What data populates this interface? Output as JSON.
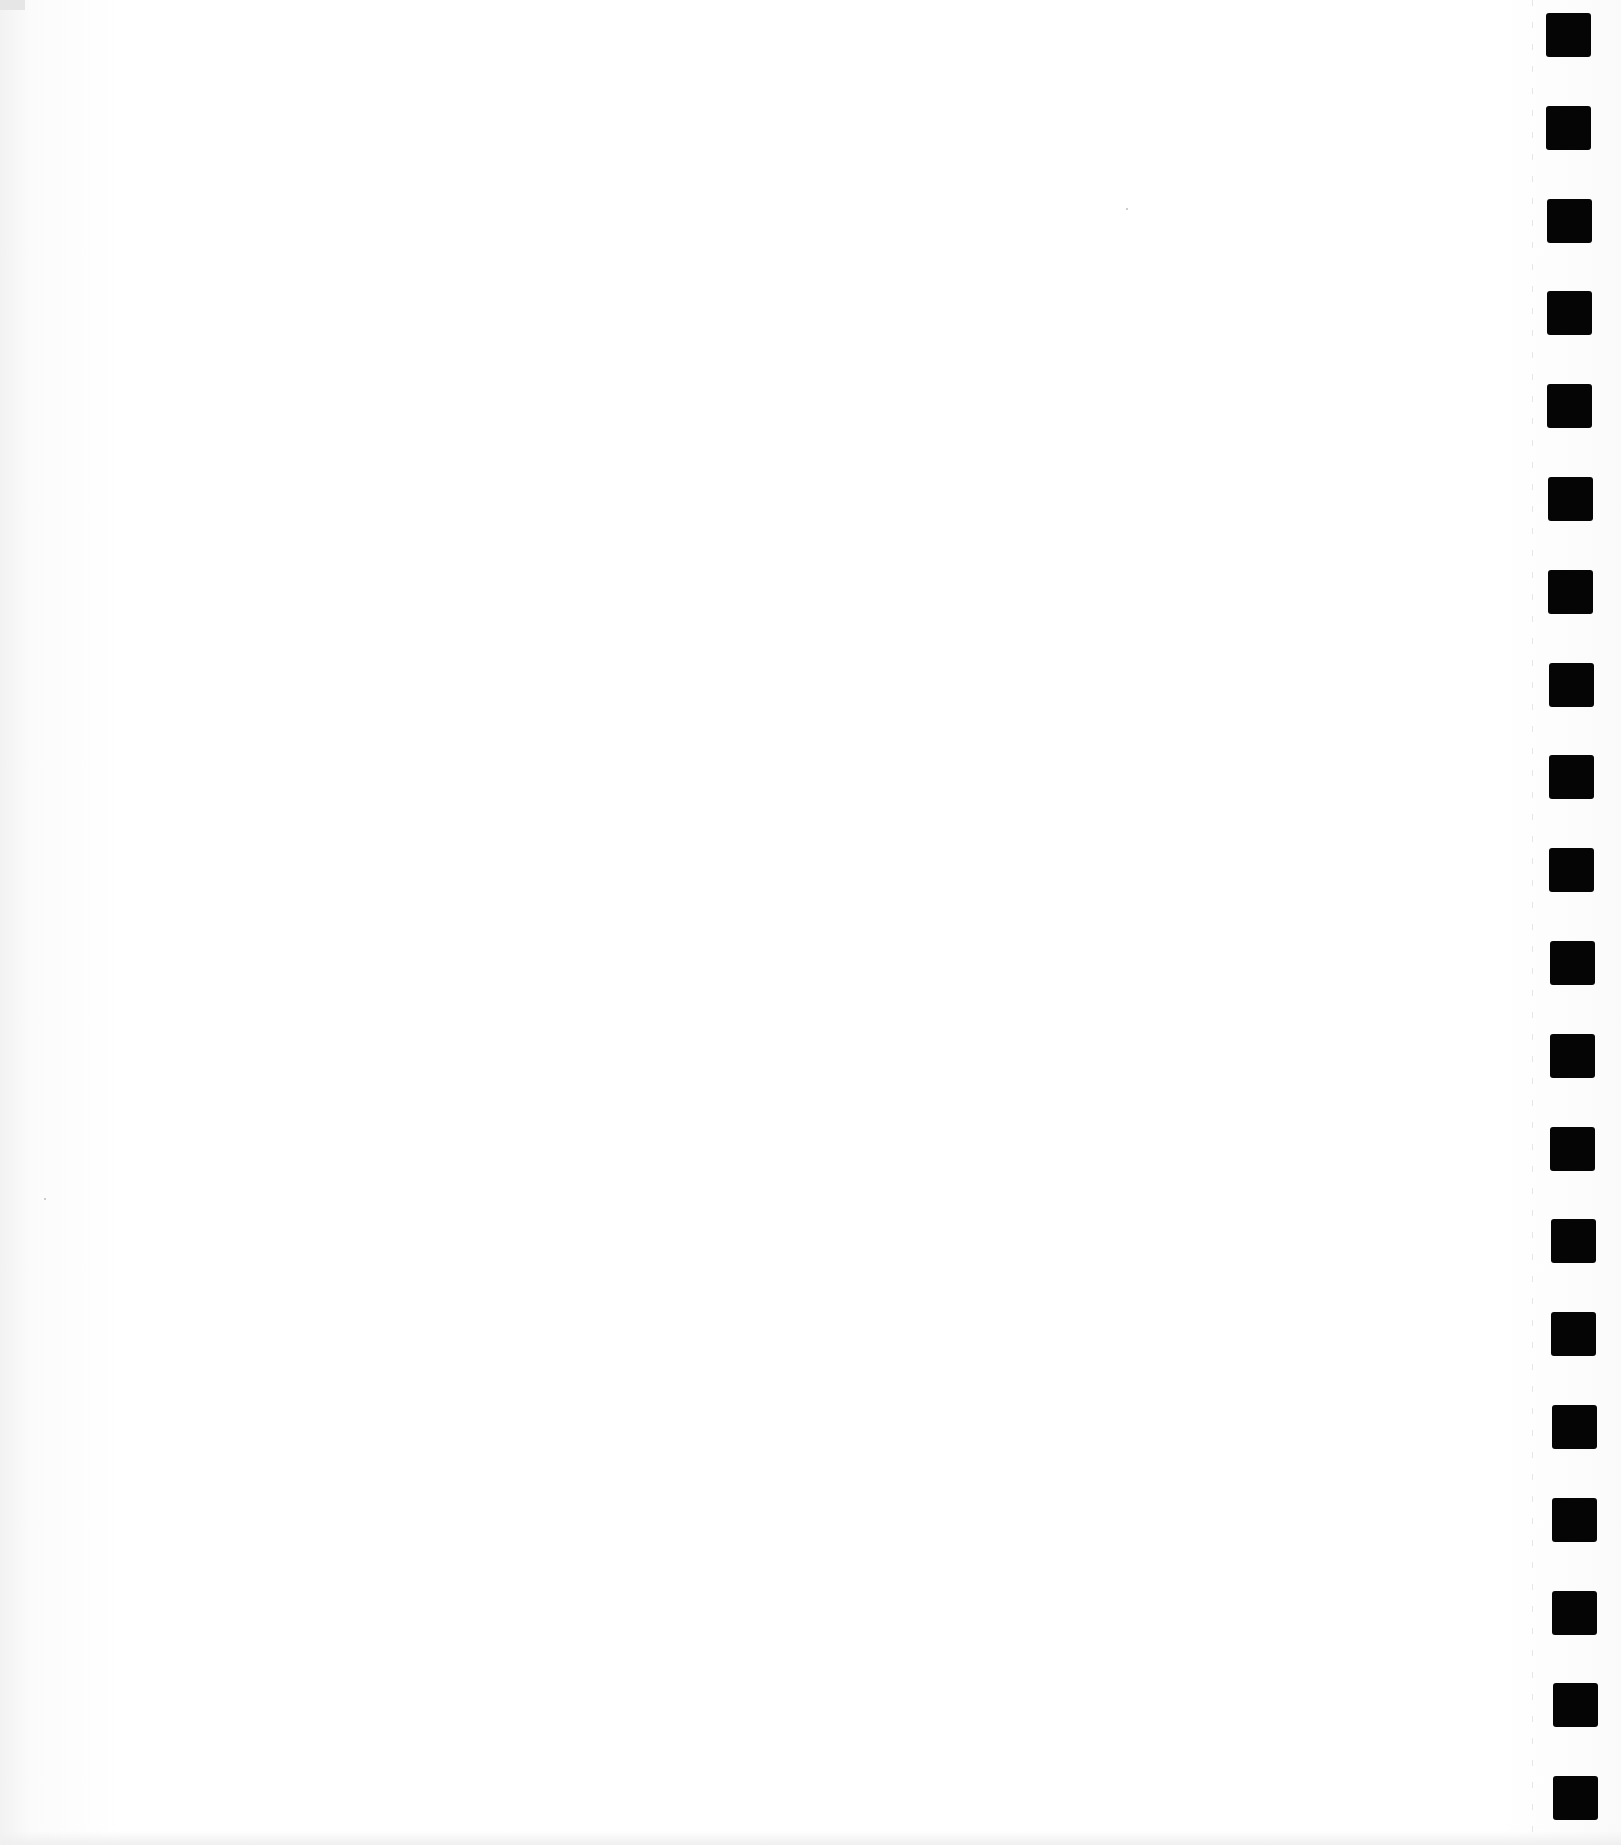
{
  "page": {
    "type": "blank scanned continuous-feed page",
    "background_color": "#ffffff",
    "text_content": ""
  },
  "tractor_feed": {
    "count": 20,
    "color": "#050505",
    "square_size_px": [
      45,
      44
    ],
    "first_y": 13,
    "pitch_y": 92.8,
    "x_start": 1546,
    "x_end": 1553
  }
}
